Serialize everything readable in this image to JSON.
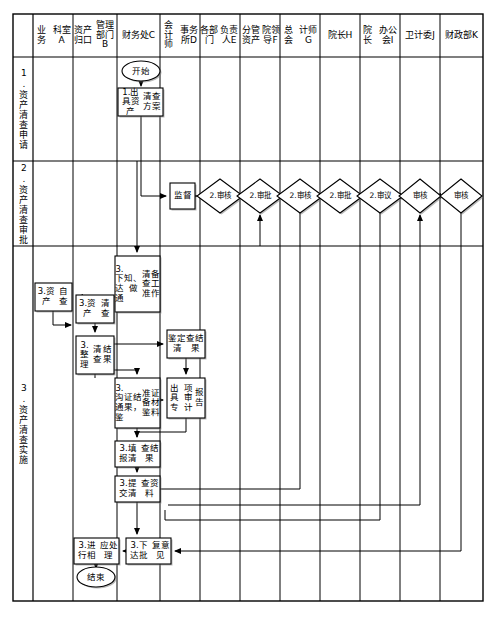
{
  "diagram": {
    "type": "cross-functional-flowchart",
    "columns": [
      {
        "id": "A",
        "label": "业务\n科室A",
        "x": 33,
        "w": 40
      },
      {
        "id": "B",
        "label": "资产归口\n管理部门B",
        "x": 73,
        "w": 44
      },
      {
        "id": "C",
        "label": "财务处C",
        "x": 117,
        "w": 43
      },
      {
        "id": "D",
        "label": "会计师\n事务所D",
        "x": 160,
        "w": 40
      },
      {
        "id": "E",
        "label": "各部门\n负责人E",
        "x": 200,
        "w": 40
      },
      {
        "id": "F",
        "label": "分管资产\n院领导F",
        "x": 240,
        "w": 40
      },
      {
        "id": "G",
        "label": "总会\n计师G",
        "x": 280,
        "w": 40
      },
      {
        "id": "H",
        "label": "院长H",
        "x": 320,
        "w": 40
      },
      {
        "id": "I",
        "label": "院长\n办公会I",
        "x": 360,
        "w": 40
      },
      {
        "id": "J",
        "label": "卫计委J",
        "x": 400,
        "w": 40
      },
      {
        "id": "K",
        "label": "财政\n部K",
        "x": 440,
        "w": 43
      }
    ],
    "rows": [
      {
        "id": "1",
        "label": "1.资产清查申请",
        "y": 57,
        "h": 104
      },
      {
        "id": "2",
        "label": "2.资产清查审批",
        "y": 161,
        "h": 85
      },
      {
        "id": "3",
        "label": "3.资产清查实施",
        "y": 246,
        "h": 355
      }
    ],
    "terminators": [
      {
        "name": "start",
        "label": "开始",
        "cx": 141,
        "cy": 71
      },
      {
        "name": "end",
        "label": "结束",
        "cx": 96,
        "cy": 577
      }
    ],
    "processes": [
      {
        "name": "issue-plan",
        "label": "1.出具资产\n清查方案",
        "x": 118,
        "y": 88,
        "w": 45,
        "h": 28
      },
      {
        "name": "supervise",
        "label": "监督",
        "x": 170,
        "y": 183,
        "w": 25,
        "h": 26
      },
      {
        "name": "notify-prepare",
        "label": "3.下达通\n知、做\n清查准\n备工作",
        "x": 115,
        "y": 256,
        "w": 45,
        "h": 56
      },
      {
        "name": "self-check",
        "label": "3.资产\n自查",
        "x": 35,
        "y": 283,
        "w": 37,
        "h": 28
      },
      {
        "name": "asset-check",
        "label": "3.资产\n清查",
        "x": 76,
        "y": 295,
        "w": 38,
        "h": 28
      },
      {
        "name": "sort-results",
        "label": "3.整理\n清查\n结果",
        "x": 76,
        "y": 336,
        "w": 38,
        "h": 38
      },
      {
        "name": "appraise-results",
        "label": "鉴定清\n查结果",
        "x": 167,
        "y": 330,
        "w": 38,
        "h": 28
      },
      {
        "name": "communicate-materials",
        "label": "3.沟通鉴\n证结果，\n准备鉴\n证材料",
        "x": 115,
        "y": 378,
        "w": 45,
        "h": 50
      },
      {
        "name": "audit-report",
        "label": "出具专\n项审计\n报告",
        "x": 167,
        "y": 378,
        "w": 38,
        "h": 40
      },
      {
        "name": "fill-results",
        "label": "3.填报清\n查结果",
        "x": 115,
        "y": 441,
        "w": 45,
        "h": 26
      },
      {
        "name": "submit-materials",
        "label": "3.提交清\n查资料",
        "x": 115,
        "y": 476,
        "w": 45,
        "h": 26
      },
      {
        "name": "handle-accordingly",
        "label": "3.进行相\n应处理",
        "x": 74,
        "y": 538,
        "w": 45,
        "h": 26
      },
      {
        "name": "issue-reply",
        "label": "3.下达批\n复意见",
        "x": 126,
        "y": 538,
        "w": 45,
        "h": 26
      }
    ],
    "decisions": [
      {
        "name": "review-d",
        "label": "2.审核",
        "cx": 220,
        "cy": 196,
        "rx": 23,
        "ry": 17
      },
      {
        "name": "approve-e",
        "label": "2.审批",
        "cx": 260,
        "cy": 196,
        "rx": 23,
        "ry": 17
      },
      {
        "name": "review-f",
        "label": "2.审核",
        "cx": 300,
        "cy": 196,
        "rx": 23,
        "ry": 17
      },
      {
        "name": "approve-g",
        "label": "2.审批",
        "cx": 340,
        "cy": 196,
        "rx": 23,
        "ry": 17
      },
      {
        "name": "deliberate-h",
        "label": "2.审议",
        "cx": 380,
        "cy": 196,
        "rx": 23,
        "ry": 17
      },
      {
        "name": "verify-j",
        "label": "审核",
        "cx": 420,
        "cy": 196,
        "rx": 21,
        "ry": 17
      },
      {
        "name": "verify-k",
        "label": "审核",
        "cx": 461,
        "cy": 196,
        "rx": 21,
        "ry": 17
      }
    ],
    "colors": {
      "line": "#000000",
      "fill": "#ffffff",
      "text": "#000000",
      "shadow": "#808080"
    }
  }
}
